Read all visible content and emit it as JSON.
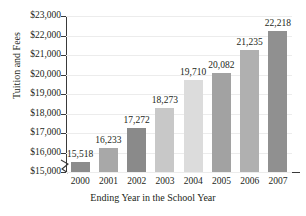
{
  "chart_data": {
    "type": "bar",
    "title": "",
    "xlabel": "Ending Year in the School Year",
    "ylabel": "Tuition and Fees",
    "categories": [
      "2000",
      "2001",
      "2002",
      "2003",
      "2004",
      "2005",
      "2006",
      "2007"
    ],
    "values": [
      15518,
      16233,
      17272,
      18273,
      19710,
      20082,
      21235,
      22218
    ],
    "value_labels": [
      "15,518",
      "16,233",
      "17,272",
      "18,273",
      "19,710",
      "20,082",
      "21,235",
      "22,218"
    ],
    "bar_colors": [
      "#8c8c8c",
      "#a8a8a8",
      "#8a8a8a",
      "#c8c8c8",
      "#dcdcdc",
      "#a2a2a2",
      "#b0b0b0",
      "#909090"
    ],
    "ylim": [
      15000,
      23000
    ],
    "ytick_values": [
      15000,
      16000,
      17000,
      18000,
      19000,
      20000,
      21000,
      22000,
      23000
    ],
    "ytick_labels": [
      "$15,000",
      "$16,000",
      "$17,000",
      "$18,000",
      "$19,000",
      "$20,000",
      "$21,000",
      "$22,000",
      "$23,000"
    ],
    "grid": true,
    "axis_break": true,
    "legend": "none"
  },
  "axes": {
    "y_title": "Tuition and Fees",
    "x_title": "Ending Year in the School Year"
  }
}
